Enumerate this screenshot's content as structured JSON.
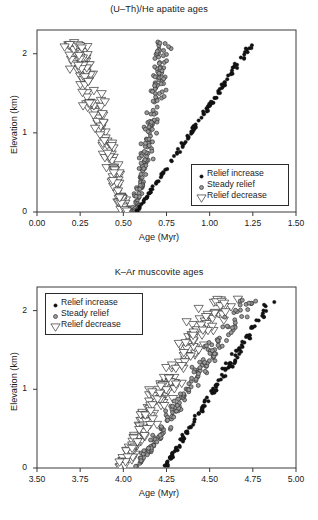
{
  "figure": {
    "width": 318,
    "height": 520,
    "background": "#ffffff"
  },
  "series_styles": {
    "relief_increase": {
      "marker": "filled-circle",
      "fill": "#111111",
      "stroke": "#111111",
      "size": 3.5
    },
    "steady_relief": {
      "marker": "gray-circle",
      "fill": "#9a9a9a",
      "stroke": "#333333",
      "size": 4.0
    },
    "relief_decrease": {
      "marker": "open-down-triangle",
      "fill": "#ffffff",
      "stroke": "#333333",
      "size": 4.6
    }
  },
  "chart_data": [
    {
      "id": "apatite",
      "type": "scatter",
      "title": "(U–Th)/He apatite ages",
      "xlabel": "Age (Myr)",
      "ylabel": "Elevation (km)",
      "xlim": [
        0.0,
        1.5
      ],
      "ylim": [
        0.0,
        2.3
      ],
      "xticks": [
        0.0,
        0.25,
        0.5,
        0.75,
        1.0,
        1.25,
        1.5
      ],
      "xticklabels": [
        "0.00",
        "0.25",
        "0.50",
        "0.75",
        "1.00",
        "1.25",
        "1.50"
      ],
      "yticks": [
        0,
        1,
        2
      ],
      "yticklabels": [
        "0",
        "1",
        "2"
      ],
      "grid": false,
      "legend_position": "lower-right",
      "plot_box": {
        "left": 37,
        "top": 30,
        "right": 296,
        "bottom": 212
      },
      "legend_box": {
        "left": 191,
        "top": 164,
        "width": 98,
        "height": 42
      },
      "series": [
        {
          "name": "Relief increase",
          "style": "relief_increase",
          "n": 120,
          "model": "linear-band",
          "x_at_y0": 0.575,
          "x_at_ymax": 1.245,
          "scatter_x": 0.013,
          "y_min": 0.0,
          "y_max": 2.13
        },
        {
          "name": "Steady relief",
          "style": "steady_relief",
          "n": 175,
          "model": "curved-band",
          "x_at_y0": 0.565,
          "x_at_ymax": 0.735,
          "curvature": 0.28,
          "scatter_x": 0.036,
          "y_min": 0.0,
          "y_max": 2.15
        },
        {
          "name": "Relief decrease",
          "style": "relief_decrease",
          "n": 170,
          "model": "inverse-band",
          "x_at_y0": 0.505,
          "x_at_ymax": 0.215,
          "curvature": -0.22,
          "scatter_x": 0.052,
          "y_min": 0.0,
          "y_max": 2.14
        }
      ]
    },
    {
      "id": "muscovite",
      "type": "scatter",
      "title": "K–Ar muscovite ages",
      "xlabel": "Age (Myr)",
      "ylabel": "Elevation (km)",
      "xlim": [
        3.5,
        5.0
      ],
      "ylim": [
        0.0,
        2.3
      ],
      "xticks": [
        3.5,
        3.75,
        4.0,
        4.25,
        4.5,
        4.75,
        5.0
      ],
      "xticklabels": [
        "3.50",
        "3.75",
        "4.00",
        "4.25",
        "4.50",
        "4.75",
        "5.00"
      ],
      "yticks": [
        0,
        1,
        2
      ],
      "yticklabels": [
        "0",
        "1",
        "2"
      ],
      "grid": false,
      "legend_position": "upper-left",
      "plot_box": {
        "left": 37,
        "top": 29,
        "right": 296,
        "bottom": 210
      },
      "legend_box": {
        "left": 45,
        "top": 35,
        "width": 98,
        "height": 42
      },
      "series": [
        {
          "name": "Relief increase",
          "style": "relief_increase",
          "n": 130,
          "model": "linear-band",
          "x_at_y0": 4.235,
          "x_at_ymax": 4.855,
          "scatter_x": 0.02,
          "y_min": 0.0,
          "y_max": 2.13
        },
        {
          "name": "Steady relief",
          "style": "steady_relief",
          "n": 175,
          "model": "linear-band",
          "x_at_y0": 4.075,
          "x_at_ymax": 4.715,
          "scatter_x": 0.046,
          "y_min": 0.0,
          "y_max": 2.15
        },
        {
          "name": "Relief decrease",
          "style": "relief_decrease",
          "n": 185,
          "model": "linear-band",
          "x_at_y0": 3.985,
          "x_at_ymax": 4.545,
          "scatter_x": 0.072,
          "y_min": 0.0,
          "y_max": 2.14
        }
      ]
    }
  ],
  "legend": {
    "entries": [
      {
        "label": "Relief increase",
        "style": "relief_increase"
      },
      {
        "label": "Steady relief",
        "style": "steady_relief"
      },
      {
        "label": "Relief decrease",
        "style": "relief_decrease"
      }
    ]
  }
}
